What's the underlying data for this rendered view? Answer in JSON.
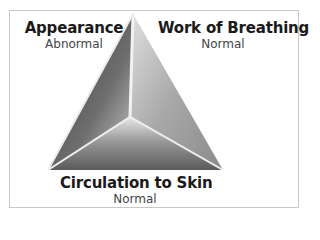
{
  "diagram": {
    "sides": [
      {
        "id": "appearance",
        "label": "Appearance",
        "status": "Abnormal"
      },
      {
        "id": "work_of_breathing",
        "label": "Work of Breathing",
        "status": "Normal"
      },
      {
        "id": "circulation",
        "label": "Circulation to Skin",
        "status": "Normal"
      }
    ],
    "colors": {
      "frame": "#c8c8c8",
      "face_dark": "#4a4a4a",
      "face_mid": "#8a8a8a",
      "face_light": "#d8d8d8"
    }
  }
}
